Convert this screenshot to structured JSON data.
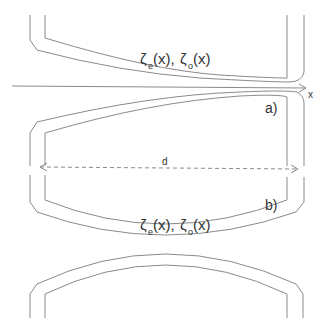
{
  "diagram": {
    "type": "geometry-schematic",
    "labels": {
      "axis_x": "x",
      "panel_a": "a)",
      "panel_b": "b)",
      "distance": "d",
      "top_func_zeta1": "ζ",
      "top_func_sub1": "e",
      "top_func_arg1": "(x),",
      "top_func_zeta2": "ζ",
      "top_func_sub2": "o",
      "top_func_arg2": "(x)",
      "mid_func_zeta1": "ζ",
      "mid_func_sub1": "e",
      "mid_func_arg1": "(x),",
      "mid_func_zeta2": "ζ",
      "mid_func_sub2": "o",
      "mid_func_arg2": "(x)"
    },
    "colors": {
      "line": "#8a8a8a",
      "text": "#333333",
      "background": "#ffffff"
    }
  }
}
